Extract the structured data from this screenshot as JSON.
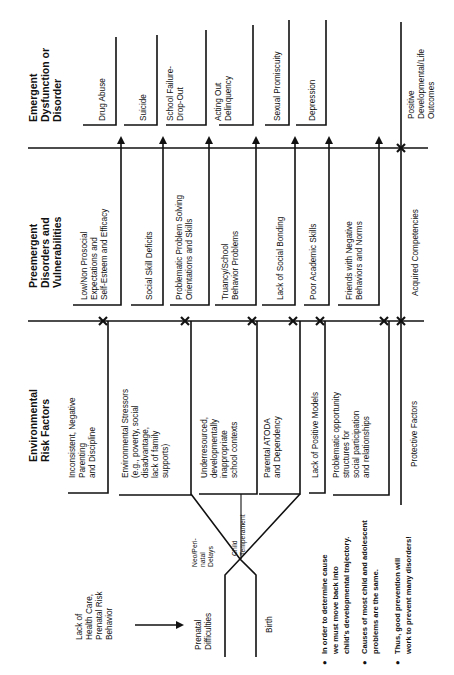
{
  "orientation": "rotated-90-ccw",
  "columns": {
    "emergent": {
      "title": [
        "Emergent",
        "Dysfunction or",
        "Disorder"
      ],
      "items": [
        {
          "lines": [
            "Drug Abuse"
          ]
        },
        {
          "lines": [
            "Suicide"
          ]
        },
        {
          "lines": [
            "School Failure-",
            "Drop-Out"
          ]
        },
        {
          "lines": [
            "Acting Out",
            "Delinquency"
          ]
        },
        {
          "lines": [
            "Sexual Promiscuity"
          ]
        },
        {
          "lines": [
            "Depression"
          ]
        }
      ],
      "positive": {
        "lines": [
          "Positive",
          "Developmental/Life",
          "Outcomes"
        ]
      }
    },
    "preemergent": {
      "title": [
        "Preemergent",
        "Disorders and",
        "Vulnerabilities"
      ],
      "items": [
        {
          "lines": [
            "Low/Non Prosocial",
            "Expectations and",
            "Self-Esteem and Efficacy"
          ]
        },
        {
          "lines": [
            "Social Skill Deficits"
          ]
        },
        {
          "lines": [
            "Problematic Problem Solving",
            "Orientations and Skills"
          ]
        },
        {
          "lines": [
            "Truancy/School",
            "Behavior Problems"
          ]
        },
        {
          "lines": [
            "Lack of Social Bonding"
          ]
        },
        {
          "lines": [
            "Poor Academic Skills"
          ]
        },
        {
          "lines": [
            "Friends with Negative",
            "Behaviors and Norms"
          ]
        }
      ],
      "positive": {
        "lines": [
          "Acquired Competencies"
        ]
      }
    },
    "environmental": {
      "title": [
        "Environmental",
        "Risk Factors"
      ],
      "items": [
        {
          "lines": [
            "Inconsistent, Negative",
            "Parenting",
            "and Discipline"
          ]
        },
        {
          "lines": [
            "Environmental Stressors",
            "(e.g., poverty, social",
            "disadvantage,",
            "lack of family",
            "supports)"
          ]
        },
        {
          "lines": [
            "Underresourced,",
            "developmentally",
            "inappropriate",
            "school contexts"
          ]
        },
        {
          "lines": [
            "Parental ATODA",
            "and Dependency"
          ]
        },
        {
          "lines": [
            "Lack of Positive Models"
          ]
        },
        {
          "lines": [
            "Problematic opportunity",
            "structures for",
            "social participation",
            "and relationships"
          ]
        }
      ],
      "positive": {
        "lines": [
          "Protective Factors"
        ]
      }
    }
  },
  "early": {
    "cause": {
      "lines": [
        "Lack of",
        "Health Care,",
        "Prenatal Risk",
        "Behavior"
      ]
    },
    "prenatal": {
      "lines": [
        "Prenatal",
        "Difficulties"
      ]
    },
    "birth": {
      "lines": [
        "Birth"
      ]
    },
    "neo": {
      "lines": [
        "Neo/Peri-",
        "natal",
        "Delays"
      ]
    },
    "temperament": {
      "lines": [
        "Child",
        "Temperament"
      ]
    }
  },
  "notes": [
    {
      "bullet": "●",
      "lines": [
        "In order to determine cause",
        "we must move back into",
        "child's developmental trajectory."
      ]
    },
    {
      "bullet": "●",
      "lines": [
        "Causes of most child and adolescent",
        "problems are the same."
      ]
    },
    {
      "bullet": "●",
      "lines": [
        "Thus, good prevention will",
        "work to prevent many disorders!"
      ]
    }
  ],
  "colors": {
    "ink": "#111111",
    "background": "#ffffff"
  }
}
